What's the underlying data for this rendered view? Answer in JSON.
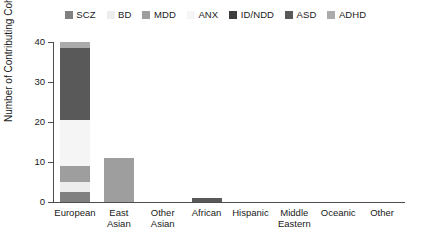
{
  "chart_data": {
    "type": "bar",
    "stacked": true,
    "title": "",
    "xlabel": "",
    "ylabel": "Number of Contributing Cohorts",
    "ylim": [
      0,
      40
    ],
    "yticks": [
      0,
      10,
      20,
      30,
      40
    ],
    "grid": false,
    "legend_position": "top-center",
    "categories": [
      "European",
      "East Asian",
      "Other Asian",
      "African",
      "Hispanic",
      "Middle Eastern",
      "Oceanic",
      "Other"
    ],
    "category_lines": [
      [
        "European"
      ],
      [
        "East",
        "Asian"
      ],
      [
        "Other",
        "Asian"
      ],
      [
        "African"
      ],
      [
        "Hispanic"
      ],
      [
        "Middle",
        "Eastern"
      ],
      [
        "Oceanic"
      ],
      [
        "Other"
      ]
    ],
    "series": [
      {
        "name": "SCZ",
        "color": "#808080",
        "values": [
          2.5,
          0,
          0,
          0,
          0,
          0,
          0,
          0
        ]
      },
      {
        "name": "BD",
        "color": "#ededed",
        "values": [
          2.5,
          0,
          0,
          0,
          0,
          0,
          0,
          0
        ]
      },
      {
        "name": "MDD",
        "color": "#9e9e9e",
        "values": [
          4,
          11,
          0,
          0,
          0,
          0,
          0,
          0
        ]
      },
      {
        "name": "ANX",
        "color": "#f5f5f5",
        "values": [
          11.5,
          0,
          0,
          0,
          0,
          0,
          0,
          0
        ]
      },
      {
        "name": "ID/NDD",
        "color": "#3d3d3d",
        "values": [
          0,
          0,
          0,
          0,
          0,
          0,
          0,
          0
        ]
      },
      {
        "name": "ASD",
        "color": "#595959",
        "values": [
          18,
          0,
          0,
          1,
          0,
          0,
          0,
          0
        ]
      },
      {
        "name": "ADHD",
        "color": "#ababab",
        "values": [
          1.5,
          0,
          0,
          0,
          0,
          0,
          0,
          0
        ]
      }
    ],
    "totals": [
      40,
      11,
      0,
      1,
      0,
      0,
      0,
      0
    ]
  },
  "axis": {
    "ytick_labels": [
      "0",
      "10",
      "20",
      "30",
      "40"
    ]
  },
  "colors": {
    "axis": "#4d4d4d",
    "text": "#1a1a1a",
    "background": "#ffffff"
  }
}
